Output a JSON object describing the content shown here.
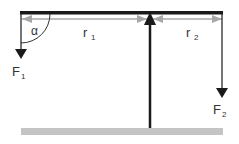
{
  "diagram": {
    "type": "lever",
    "labels": {
      "alpha": "α",
      "r1": "r",
      "r1_sub": "1",
      "r2": "r",
      "r2_sub": "2",
      "f1": "F",
      "f1_sub": "1",
      "f2": "F",
      "f2_sub": "2"
    },
    "colors": {
      "beam": "#1a1a1a",
      "dimension": "#a8a8a8",
      "ground": "#c4c4c4",
      "force": "#1a1a1a"
    }
  }
}
